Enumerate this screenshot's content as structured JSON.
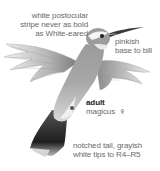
{
  "illustration": {
    "subject": "hummingbird",
    "age": "adult",
    "subspecies": "magicus",
    "sex_symbol": "♀",
    "sex": "female"
  },
  "annotations": {
    "postocular": [
      "white postocular",
      "stripe never as bold",
      "as White-eared"
    ],
    "bill": [
      "pinkish",
      "base to bill"
    ],
    "tail": [
      "notched tail, grayish",
      "white tips to R4–R5"
    ]
  },
  "labels": {
    "age": "adult",
    "subspecies": "magicus",
    "sex_symbol": "♀"
  },
  "colors": {
    "text": "#6a6a6a",
    "title": "#222222",
    "bird_dark": "#2a2a2a",
    "bird_mid": "#8a8a8a",
    "bird_light": "#d9d9d9"
  }
}
